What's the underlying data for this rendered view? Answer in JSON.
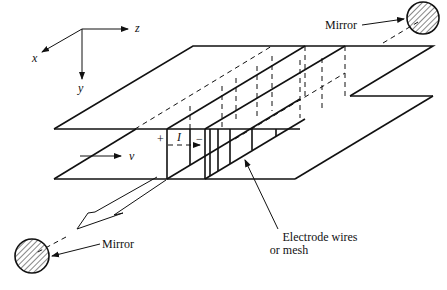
{
  "figure": {
    "type": "free-electron laser / wiggler apparatus schematic",
    "axes": {
      "x_label": "x",
      "y_label": "y",
      "z_label": "z"
    },
    "labels": {
      "mirror_top": "Mirror",
      "mirror_bottom": "Mirror",
      "electrode_line1": "Electrode wires",
      "electrode_line2": "or mesh",
      "velocity": "v",
      "current": "I",
      "plus": "+",
      "minus": "−"
    },
    "colors": {
      "ink": "#111111",
      "background": "#ffffff"
    }
  }
}
